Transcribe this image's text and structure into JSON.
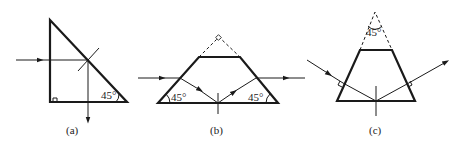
{
  "figure": {
    "panels": [
      {
        "id": "a",
        "caption": "(a)",
        "angle_labels": [
          "45°"
        ]
      },
      {
        "id": "b",
        "caption": "(b)",
        "angle_labels": [
          "45°",
          "45°"
        ]
      },
      {
        "id": "c",
        "caption": "(c)",
        "angle_labels": [
          "45°"
        ]
      }
    ]
  }
}
